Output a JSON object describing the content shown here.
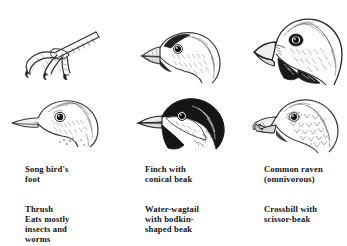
{
  "plate": {
    "title": "Bird beaks and feet illustration plate",
    "background_color": "#ffffff",
    "ink_color": "#131313"
  },
  "figures": [
    {
      "id": "fig-foot",
      "icon": "bird-foot-claw-icon",
      "subject": "Song bird's foot",
      "column": 1,
      "row": 1
    },
    {
      "id": "fig-thrush",
      "icon": "thrush-head-icon",
      "subject": "Thrush head with slender beak",
      "column": 1,
      "row": 2
    },
    {
      "id": "fig-finch",
      "icon": "finch-head-icon",
      "subject": "Finch head with conical beak",
      "column": 2,
      "row": 1
    },
    {
      "id": "fig-wagtail",
      "icon": "water-wagtail-head-icon",
      "subject": "Water-wagtail head with bodkin-shaped beak",
      "column": 2,
      "row": 2
    },
    {
      "id": "fig-raven",
      "icon": "raven-head-icon",
      "subject": "Common raven head with heavy beak",
      "column": 3,
      "row": 1
    },
    {
      "id": "fig-crossbill",
      "icon": "crossbill-head-icon",
      "subject": "Crossbill head with crossed scissor beak",
      "column": 3,
      "row": 2
    }
  ],
  "captions": {
    "column_1": [
      "Song bird's\nfoot",
      "Thrush\nEats mostly\ninsects and\nworms"
    ],
    "column_2": [
      "Finch with\nconical beak",
      "Water-wagtail\nwith bodkin-\nshaped beak"
    ],
    "column_3": [
      "Common raven\n(omnivorous)",
      "Crossbill with\nscissor-beak"
    ]
  }
}
